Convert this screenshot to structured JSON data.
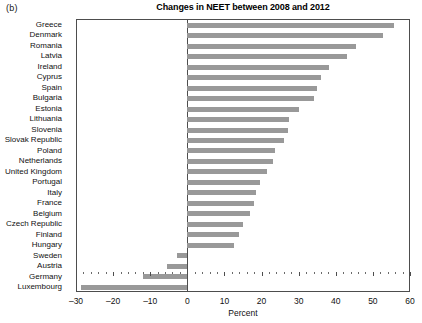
{
  "figure": {
    "panel_tag": "(b)",
    "title": "Changes in NEET between 2008 and 2012"
  },
  "chart_data": {
    "type": "bar",
    "orientation": "horizontal",
    "title": "Changes in NEET between 2008 and 2012",
    "xlabel": "Percent",
    "ylabel": "",
    "xlim": [
      -30,
      60
    ],
    "xticks": [
      -30,
      -20,
      -10,
      0,
      10,
      20,
      30,
      40,
      50,
      60
    ],
    "xtick_labels": [
      "–30",
      "–20",
      "–10",
      "0",
      "10",
      "20",
      "30",
      "40",
      "50",
      "60"
    ],
    "grid": false,
    "legend": null,
    "bar_color": "#999999",
    "categories": [
      "Greece",
      "Denmark",
      "Romania",
      "Latvia",
      "Ireland",
      "Cyprus",
      "Spain",
      "Bulgaria",
      "Estonia",
      "Lithuania",
      "Slovenia",
      "Slovak Republic",
      "Poland",
      "Netherlands",
      "United Kingdom",
      "Portugal",
      "Italy",
      "France",
      "Belgium",
      "Czech Republic",
      "Finland",
      "Hungary",
      "Sweden",
      "Austria",
      "Germany",
      "Luxembourg"
    ],
    "values": [
      55.7,
      52.7,
      45.5,
      43.0,
      38.3,
      36.0,
      35.0,
      34.0,
      30.0,
      27.5,
      27.0,
      26.0,
      23.5,
      23.0,
      21.5,
      19.5,
      18.5,
      18.0,
      17.0,
      15.0,
      14.0,
      12.5,
      -2.7,
      -5.4,
      -12.0,
      -28.6
    ]
  }
}
